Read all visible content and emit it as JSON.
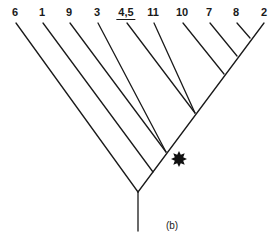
{
  "diagram": {
    "type": "cladogram",
    "caption": "(b)",
    "tips": [
      {
        "label": "6",
        "x": 15,
        "underlined": false
      },
      {
        "label": "1",
        "x": 42,
        "underlined": false
      },
      {
        "label": "9",
        "x": 69,
        "underlined": false
      },
      {
        "label": "3",
        "x": 97,
        "underlined": false
      },
      {
        "label": "4,5",
        "x": 126,
        "underlined": true
      },
      {
        "label": "11",
        "x": 153,
        "underlined": false
      },
      {
        "label": "10",
        "x": 182,
        "underlined": false
      },
      {
        "label": "7",
        "x": 209,
        "underlined": false
      },
      {
        "label": "8",
        "x": 236,
        "underlined": false
      },
      {
        "label": "2",
        "x": 264,
        "underlined": false
      }
    ],
    "marker": {
      "symbol": "starburst",
      "color": "#111111",
      "near_node": "node-9-3"
    },
    "topology": "(6,(1,((9,3),((4,5,11),(10,(7,(8,2)))))))"
  }
}
